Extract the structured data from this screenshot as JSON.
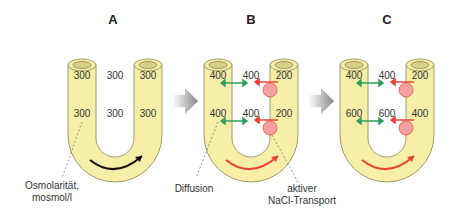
{
  "panels": [
    {
      "label": "A",
      "values": {
        "top_left": "300",
        "top_mid": "300",
        "top_right": "300",
        "bot_left": "300",
        "bot_mid": "300",
        "bot_right": "300"
      }
    },
    {
      "label": "B",
      "values": {
        "top_left": "400",
        "top_mid": "400",
        "top_right": "200",
        "bot_left": "400",
        "bot_mid": "400",
        "bot_right": "200"
      }
    },
    {
      "label": "C",
      "values": {
        "top_left": "400",
        "top_mid": "400",
        "top_right": "200",
        "bot_left": "600",
        "bot_mid": "600",
        "bot_right": "400"
      }
    }
  ],
  "annotations": {
    "osmolarity_line1": "Osmolarität,",
    "osmolarity_line2": "mosmol/l",
    "diffusion": "Diffusion",
    "transport_line1": "aktiver",
    "transport_line2": "NaCl-Transport"
  },
  "colors": {
    "tube": "#f7efa8",
    "tube_stroke": "#8a8450",
    "diffusion": "#2e9e5b",
    "transport": "#e8403a",
    "pump": "#f4a0a0"
  }
}
